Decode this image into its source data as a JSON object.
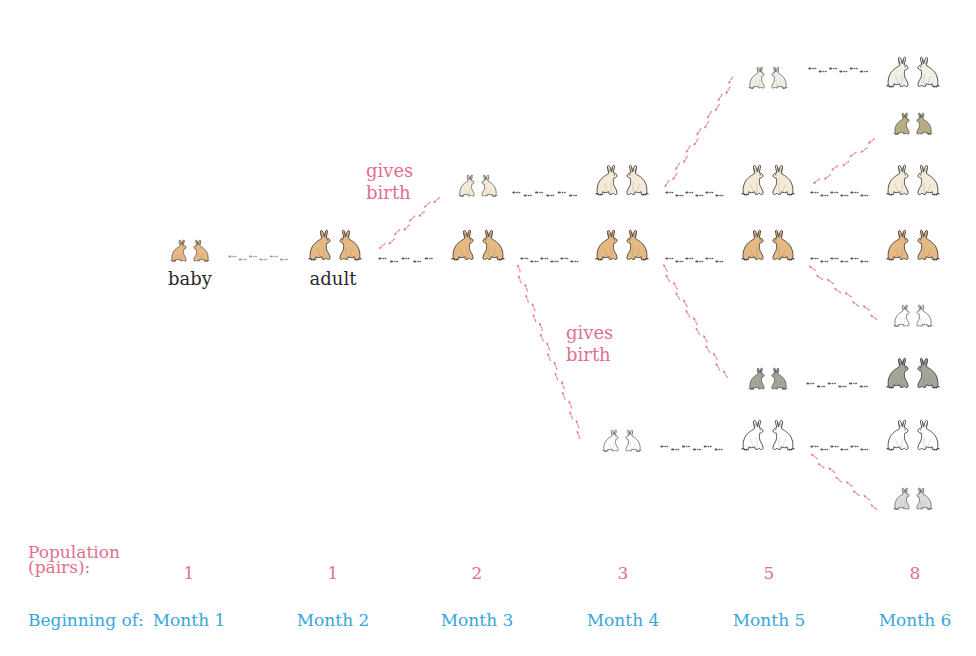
{
  "diagram": {
    "colors": {
      "label_pink": "#e0708e",
      "label_blue": "#3aa6dc",
      "birth_tracks": "#e77b98",
      "age_tracks": "#555555",
      "baby_tracks": "#9a9a9a"
    },
    "stage_labels": {
      "baby": "baby",
      "adult": "adult"
    },
    "birth_labels": [
      {
        "line1": "gives",
        "line2": "birth"
      },
      {
        "line1": "gives",
        "line2": "birth"
      }
    ],
    "rabbit_pairs": [
      {
        "id": "m1-a",
        "month": 1,
        "x": 190,
        "y": 245,
        "size": "small",
        "fill": "#e6b984"
      },
      {
        "id": "m2-a",
        "month": 2,
        "x": 335,
        "y": 245,
        "size": "large",
        "fill": "#e6b984"
      },
      {
        "id": "m3-a",
        "month": 3,
        "x": 478,
        "y": 245,
        "size": "large",
        "fill": "#e6b984"
      },
      {
        "id": "m3-b",
        "month": 3,
        "x": 478,
        "y": 180,
        "size": "small",
        "fill": "#f5ead7"
      },
      {
        "id": "m4-a",
        "month": 4,
        "x": 622,
        "y": 245,
        "size": "large",
        "fill": "#e6b984"
      },
      {
        "id": "m4-b",
        "month": 4,
        "x": 622,
        "y": 180,
        "size": "large",
        "fill": "#f5ead7"
      },
      {
        "id": "m4-c",
        "month": 4,
        "x": 622,
        "y": 435,
        "size": "small",
        "fill": "#ffffff"
      },
      {
        "id": "m5-a",
        "month": 5,
        "x": 768,
        "y": 245,
        "size": "large",
        "fill": "#e6b984"
      },
      {
        "id": "m5-b",
        "month": 5,
        "x": 768,
        "y": 180,
        "size": "large",
        "fill": "#f5ead7"
      },
      {
        "id": "m5-c",
        "month": 5,
        "x": 768,
        "y": 435,
        "size": "large",
        "fill": "#ffffff"
      },
      {
        "id": "m5-d",
        "month": 5,
        "x": 768,
        "y": 72,
        "size": "small",
        "fill": "#f2efe6"
      },
      {
        "id": "m5-e",
        "month": 5,
        "x": 768,
        "y": 373,
        "size": "small",
        "fill": "#a7a49a"
      },
      {
        "id": "m6-a",
        "month": 6,
        "x": 913,
        "y": 245,
        "size": "large",
        "fill": "#e6b984"
      },
      {
        "id": "m6-b",
        "month": 6,
        "x": 913,
        "y": 180,
        "size": "large",
        "fill": "#f5ead7"
      },
      {
        "id": "m6-c",
        "month": 6,
        "x": 913,
        "y": 435,
        "size": "large",
        "fill": "#ffffff"
      },
      {
        "id": "m6-d",
        "month": 6,
        "x": 913,
        "y": 72,
        "size": "large",
        "fill": "#f2efe6"
      },
      {
        "id": "m6-e",
        "month": 6,
        "x": 913,
        "y": 373,
        "size": "large",
        "fill": "#a7a49a"
      },
      {
        "id": "m6-f",
        "month": 6,
        "x": 913,
        "y": 118,
        "size": "small",
        "fill": "#b7ae84"
      },
      {
        "id": "m6-g",
        "month": 6,
        "x": 913,
        "y": 310,
        "size": "small",
        "fill": "#ffffff"
      },
      {
        "id": "m6-h",
        "month": 6,
        "x": 913,
        "y": 493,
        "size": "small",
        "fill": "#dcdcdc"
      }
    ],
    "tracks": [
      {
        "kind": "baby",
        "x1": 228,
        "y1": 258,
        "x2": 290,
        "y2": 258
      },
      {
        "kind": "age",
        "x1": 378,
        "y1": 260,
        "x2": 436,
        "y2": 260
      },
      {
        "kind": "age",
        "x1": 520,
        "y1": 260,
        "x2": 580,
        "y2": 260
      },
      {
        "kind": "age",
        "x1": 665,
        "y1": 260,
        "x2": 725,
        "y2": 260
      },
      {
        "kind": "age",
        "x1": 810,
        "y1": 260,
        "x2": 870,
        "y2": 260
      },
      {
        "kind": "age",
        "x1": 512,
        "y1": 194,
        "x2": 580,
        "y2": 194
      },
      {
        "kind": "age",
        "x1": 665,
        "y1": 194,
        "x2": 725,
        "y2": 194
      },
      {
        "kind": "age",
        "x1": 810,
        "y1": 194,
        "x2": 870,
        "y2": 194
      },
      {
        "kind": "age",
        "x1": 660,
        "y1": 448,
        "x2": 725,
        "y2": 448
      },
      {
        "kind": "age",
        "x1": 810,
        "y1": 448,
        "x2": 870,
        "y2": 448
      },
      {
        "kind": "age",
        "x1": 808,
        "y1": 70,
        "x2": 870,
        "y2": 70
      },
      {
        "kind": "age",
        "x1": 806,
        "y1": 385,
        "x2": 870,
        "y2": 385
      },
      {
        "kind": "birth",
        "x1": 380,
        "y1": 250,
        "x2": 440,
        "y2": 195
      },
      {
        "kind": "birth",
        "x1": 516,
        "y1": 265,
        "x2": 582,
        "y2": 440
      },
      {
        "kind": "birth",
        "x1": 666,
        "y1": 188,
        "x2": 735,
        "y2": 76
      },
      {
        "kind": "birth",
        "x1": 662,
        "y1": 265,
        "x2": 727,
        "y2": 380
      },
      {
        "kind": "birth",
        "x1": 814,
        "y1": 185,
        "x2": 878,
        "y2": 138
      },
      {
        "kind": "birth",
        "x1": 808,
        "y1": 267,
        "x2": 880,
        "y2": 320
      },
      {
        "kind": "birth",
        "x1": 810,
        "y1": 455,
        "x2": 880,
        "y2": 510
      }
    ]
  },
  "footer": {
    "population_title_line1": "Population",
    "population_title_line2": "(pairs):",
    "beginning_title": "Beginning of:",
    "months": [
      {
        "label": "Month 1",
        "population": "1"
      },
      {
        "label": "Month 2",
        "population": "1"
      },
      {
        "label": "Month 3",
        "population": "2"
      },
      {
        "label": "Month 4",
        "population": "3"
      },
      {
        "label": "Month 5",
        "population": "5"
      },
      {
        "label": "Month 6",
        "population": "8"
      }
    ]
  }
}
